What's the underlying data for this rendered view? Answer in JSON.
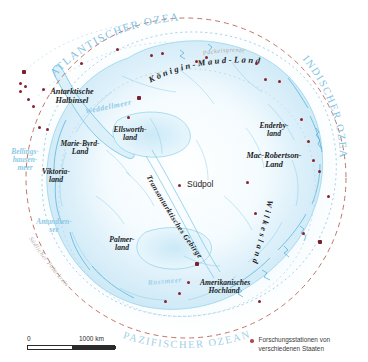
{
  "map": {
    "title": "Antarktis",
    "oceans": [
      {
        "name": "atlantic-ocean-label",
        "text": "ATLANTISCHER OZEAN"
      },
      {
        "name": "indian-ocean-label",
        "text": "INDISCHER OZEAN"
      },
      {
        "name": "pacific-ocean-label",
        "text": "PAZIFISCHER OZEAN"
      }
    ],
    "seas": [
      {
        "name": "weddell-sea-label",
        "text": "Weddellmeer"
      },
      {
        "name": "bellingshausen-sea-label",
        "line1": "Bellings-",
        "line2": "hausen-",
        "line3": "meer"
      },
      {
        "name": "amundsen-sea-label",
        "line1": "Amundsen-",
        "line2": "see"
      },
      {
        "name": "ross-sea-label",
        "text": "Rossmeer"
      }
    ],
    "regions": [
      {
        "name": "antarctic-peninsula-label",
        "line1": "Antarktische",
        "line2": "Halbinsel"
      },
      {
        "name": "queen-maud-land-label",
        "text": "Königin-Maud-Land"
      },
      {
        "name": "enderby-land-label",
        "line1": "Enderby-",
        "line2": "land"
      },
      {
        "name": "mac-robertson-land-label",
        "line1": "Mac-Robertson-",
        "line2": "Land"
      },
      {
        "name": "american-highland-label",
        "line1": "Amerikanisches",
        "line2": "Hochland"
      },
      {
        "name": "wilkes-land-label",
        "text": "Wilkesland"
      },
      {
        "name": "victoria-land-label",
        "line1": "Viktoria-",
        "line2": "land"
      },
      {
        "name": "marie-byrd-land-label",
        "line1": "Marie-Byrd-",
        "line2": "Land"
      },
      {
        "name": "ellsworth-land-label",
        "line1": "Ellsworth-",
        "line2": "land"
      },
      {
        "name": "palmer-land-label",
        "line1": "Palmer-",
        "line2": "land"
      },
      {
        "name": "filchner-ronne-label",
        "line1": "Filchner-",
        "line2": "Ronne-",
        "line3": "Schelfeis"
      },
      {
        "name": "ross-ice-shelf-label",
        "line1": "Ross-",
        "line2": "Eisschelfeis"
      },
      {
        "name": "transantarctic-mts-label",
        "text": "Transantarktisches Gebirge"
      }
    ],
    "points": [
      {
        "name": "south-pole-label",
        "text": "Südpol"
      }
    ],
    "annotations": [
      {
        "name": "pack-ice-limit-label",
        "text": "Packeisgrenze"
      },
      {
        "name": "antarctic-circle-label",
        "text": "Südlicher Polarkreis"
      }
    ],
    "scale": {
      "zero_label": "0",
      "max_label": "1000 km"
    },
    "legend": {
      "entry_text": "Forschungsstationen von\nverschiedenen Staaten"
    },
    "colors": {
      "ice": "#d9eef8",
      "ice_light": "#eaf6fc",
      "coast": "#5fb6dc",
      "station": "#8c2130",
      "ocean_text": "#7fc2e2",
      "circle_red": "#c4736b",
      "paper": "#ffffff"
    }
  }
}
